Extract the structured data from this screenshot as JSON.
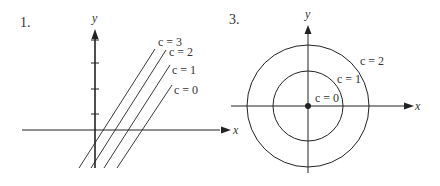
{
  "figure1": {
    "number": "1.",
    "x_axis_label": "x",
    "y_axis_label": "y",
    "curves": [
      {
        "label": "c = 3"
      },
      {
        "label": "c = 2"
      },
      {
        "label": "c = 1"
      },
      {
        "label": "c = 0"
      }
    ]
  },
  "figure3": {
    "number": "3.",
    "x_axis_label": "x",
    "y_axis_label": "y",
    "curves": [
      {
        "label": "c = 2"
      },
      {
        "label": "c = 1"
      },
      {
        "label": "c = 0"
      }
    ]
  },
  "colors": {
    "stroke": "#222222",
    "text": "#333333",
    "background": "#ffffff"
  }
}
